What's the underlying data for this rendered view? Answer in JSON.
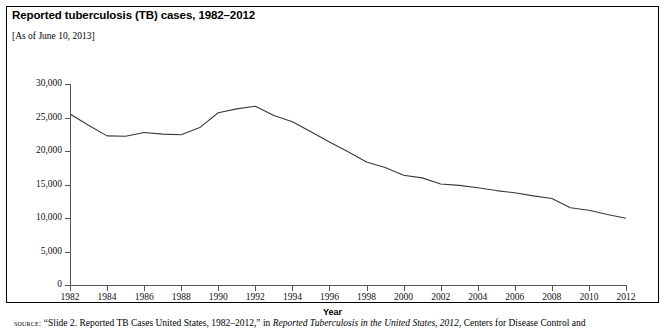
{
  "figure": {
    "title": "Reported tuberculosis (TB) cases, 1982–2012",
    "subtitle": "[As of June 10, 2013]",
    "source_label": "source:",
    "source_text_1": "“Slide 2. Reported TB Cases United States, 1982–2012,” in ",
    "source_italic": "Reported Tuberculosis in the United States, 2012",
    "source_text_2": ", Centers for Disease Control and",
    "line_color": "#3a3a3a",
    "axis_color": "#555555",
    "border_color": "#000000"
  },
  "chart_data": {
    "type": "line",
    "title": "Reported tuberculosis (TB) cases, 1982–2012",
    "xlabel": "Year",
    "ylabel": "Number of cases",
    "xlim": [
      1982,
      2012
    ],
    "ylim": [
      0,
      30000
    ],
    "grid": false,
    "legend": null,
    "x_tick_labels": [
      "1982",
      "1984",
      "1986",
      "1988",
      "1990",
      "1992",
      "1994",
      "1996",
      "1998",
      "2000",
      "2002",
      "2004",
      "2006",
      "2008",
      "2010",
      "2012"
    ],
    "y_tick_labels": [
      "0",
      "5,000",
      "10,000",
      "15,000",
      "20,000",
      "25,000",
      "30,000"
    ],
    "y_ticks": [
      0,
      5000,
      10000,
      15000,
      20000,
      25000,
      30000
    ],
    "x": [
      1982,
      1983,
      1984,
      1985,
      1986,
      1987,
      1988,
      1989,
      1990,
      1991,
      1992,
      1993,
      1994,
      1995,
      1996,
      1997,
      1998,
      1999,
      2000,
      2001,
      2002,
      2003,
      2004,
      2005,
      2006,
      2007,
      2008,
      2009,
      2010,
      2011,
      2012
    ],
    "values": [
      25520,
      23846,
      22255,
      22201,
      22768,
      22517,
      22436,
      23495,
      25701,
      26283,
      26673,
      25287,
      24361,
      22860,
      21337,
      19885,
      18361,
      17531,
      16377,
      15989,
      15075,
      14874,
      14517,
      14093,
      13767,
      13299,
      12904,
      11528,
      11163,
      10521,
      9951
    ],
    "series": [
      {
        "name": "Reported TB cases",
        "values": [
          25520,
          23846,
          22255,
          22201,
          22768,
          22517,
          22436,
          23495,
          25701,
          26283,
          26673,
          25287,
          24361,
          22860,
          21337,
          19885,
          18361,
          17531,
          16377,
          15989,
          15075,
          14874,
          14517,
          14093,
          13767,
          13299,
          12904,
          11528,
          11163,
          10521,
          9951
        ]
      }
    ]
  }
}
